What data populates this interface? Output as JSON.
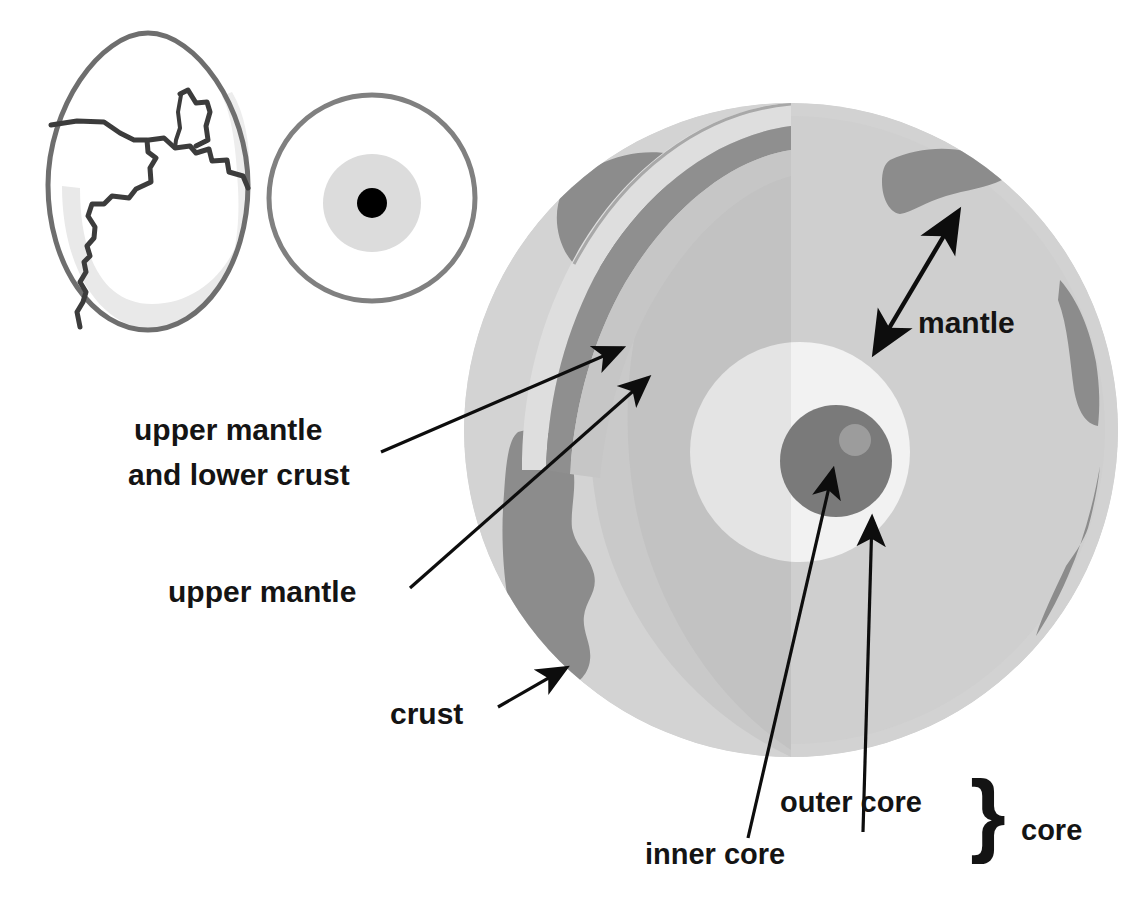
{
  "figure": {
    "background_color": "#ffffff"
  },
  "analogy": {
    "egg": {
      "name": "cracked-egg",
      "outline_color": "#6e6e6e",
      "shell_shade_color": "#e8e8e8",
      "fill_color": "#ffffff",
      "crack_color": "#3c3c3c"
    },
    "cross_section": {
      "name": "egg-cross-section",
      "outline_color": "#808080",
      "white_color": "#ffffff",
      "yolk_color": "#dcdcdc",
      "center_dot_color": "#000000"
    }
  },
  "earth": {
    "name": "earth-cutaway-sphere",
    "surface_ocean_color": "#d3d3d3",
    "surface_land_color": "#8c8c8c",
    "cut_face_light_color": "#dcdcdc",
    "upper_mantle_band_color": "#c6c6c6",
    "lower_crust_band_color": "#8a8a8a",
    "mantle_interior_color": "#c9c9c9",
    "mantle_shaded_color": "#bdbdbd",
    "outer_core_color": "#ffffff",
    "outer_core_shaded_color": "#ededed",
    "inner_core_color": "#7a7a7a",
    "inner_core_highlight_color": "#9c9c9c"
  },
  "labels": {
    "upper_mantle_and_lower_crust": {
      "line1": "upper mantle",
      "line2": "and lower crust"
    },
    "upper_mantle": "upper mantle",
    "crust": "crust",
    "mantle": "mantle",
    "inner_core": "inner core",
    "outer_core": "outer core",
    "core": "core"
  },
  "annotations": {
    "brace_symbol": "}",
    "arrow_color": "#0d0d0d",
    "mantle_arrow_type": "double-headed",
    "crust_arrow_type": "single-headed",
    "upper_mantle_arrow_type": "single-headed",
    "inner_core_arrow_type": "single-headed",
    "outer_core_arrow_type": "single-headed"
  }
}
